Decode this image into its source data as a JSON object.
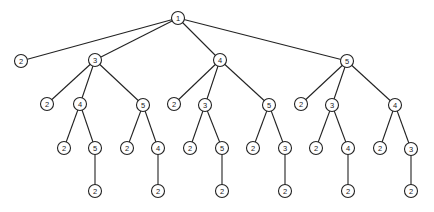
{
  "diagram": {
    "type": "tree",
    "colors": {
      "stroke": "#222222",
      "fill": "#ffffff",
      "text": "#222222"
    },
    "root": {
      "id": "n0",
      "label": "1",
      "children": [
        {
          "id": "n1",
          "label": "2",
          "children": []
        },
        {
          "id": "n2",
          "label": "3",
          "children": [
            {
              "id": "n5",
              "label": "2",
              "children": []
            },
            {
              "id": "n6",
              "label": "4",
              "children": [
                {
                  "id": "n14",
                  "label": "2",
                  "children": []
                },
                {
                  "id": "n15",
                  "label": "5",
                  "children": [
                    {
                      "id": "n26",
                      "label": "2",
                      "children": []
                    }
                  ]
                }
              ]
            },
            {
              "id": "n7",
              "label": "5",
              "children": [
                {
                  "id": "n16",
                  "label": "2",
                  "children": []
                },
                {
                  "id": "n17",
                  "label": "4",
                  "children": [
                    {
                      "id": "n27",
                      "label": "2",
                      "children": []
                    }
                  ]
                }
              ]
            }
          ]
        },
        {
          "id": "n3",
          "label": "4",
          "children": [
            {
              "id": "n8",
              "label": "2",
              "children": []
            },
            {
              "id": "n9",
              "label": "3",
              "children": [
                {
                  "id": "n18",
                  "label": "2",
                  "children": []
                },
                {
                  "id": "n19",
                  "label": "5",
                  "children": [
                    {
                      "id": "n28",
                      "label": "2",
                      "children": []
                    }
                  ]
                }
              ]
            },
            {
              "id": "n10",
              "label": "5",
              "children": [
                {
                  "id": "n20",
                  "label": "2",
                  "children": []
                },
                {
                  "id": "n21",
                  "label": "3",
                  "children": [
                    {
                      "id": "n29",
                      "label": "2",
                      "children": []
                    }
                  ]
                }
              ]
            }
          ]
        },
        {
          "id": "n4",
          "label": "5",
          "children": [
            {
              "id": "n11",
              "label": "2",
              "children": []
            },
            {
              "id": "n12",
              "label": "3",
              "children": [
                {
                  "id": "n22",
                  "label": "2",
                  "children": []
                },
                {
                  "id": "n23",
                  "label": "4",
                  "children": [
                    {
                      "id": "n30",
                      "label": "2",
                      "children": []
                    }
                  ]
                }
              ]
            },
            {
              "id": "n13",
              "label": "4",
              "children": [
                {
                  "id": "n24",
                  "label": "2",
                  "children": []
                },
                {
                  "id": "n25",
                  "label": "3",
                  "children": [
                    {
                      "id": "n31",
                      "label": "2",
                      "children": []
                    }
                  ]
                }
              ]
            }
          ]
        }
      ]
    }
  }
}
